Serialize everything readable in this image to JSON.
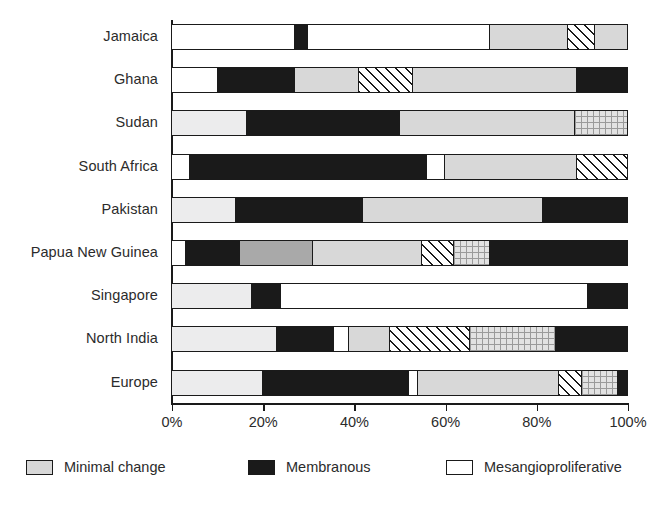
{
  "chart_data": {
    "type": "bar",
    "orientation": "horizontal",
    "stacked": true,
    "normalized": true,
    "title": "",
    "xlabel": "",
    "ylabel": "",
    "xlim": [
      0,
      100
    ],
    "grid": false,
    "legend_position": "bottom",
    "tick_labels": [
      "0%",
      "20%",
      "40%",
      "60%",
      "80%",
      "100%"
    ],
    "tick_values": [
      0,
      20,
      40,
      60,
      80,
      100
    ],
    "categories": [
      "Jamaica",
      "Ghana",
      "Sudan",
      "South Africa",
      "Pakistan",
      "Papua New Guinea",
      "Singapore",
      "North India",
      "Europe"
    ],
    "legend": [
      {
        "label": "Minimal change",
        "fill": "light",
        "swatch_color": "#ececed"
      },
      {
        "label": "Membranous",
        "fill": "black",
        "swatch_color": "#1a1a1a"
      },
      {
        "label": "Mesangioproliferative",
        "fill": "white",
        "swatch_color": "#ffffff"
      }
    ],
    "colors": {
      "white": "#ffffff",
      "black": "#1a1a1a",
      "light": "#d8d8d8",
      "lighter": "#ececed",
      "medium": "#a9a9a9",
      "hatch": "#ffffff",
      "grid": "#e2e2e2",
      "axis": "#1a1a1a",
      "text": "#2b2b2b"
    },
    "bars": [
      {
        "category": "Jamaica",
        "segments": [
          {
            "fill": "white",
            "value": 27.0
          },
          {
            "fill": "black",
            "value": 3.0
          },
          {
            "fill": "white",
            "value": 40.0
          },
          {
            "fill": "light",
            "value": 17.0
          },
          {
            "fill": "hatch",
            "value": 6.0
          },
          {
            "fill": "light",
            "value": 7.0
          }
        ]
      },
      {
        "category": "Ghana",
        "segments": [
          {
            "fill": "white",
            "value": 10.0
          },
          {
            "fill": "black",
            "value": 17.0
          },
          {
            "fill": "light",
            "value": 14.0
          },
          {
            "fill": "hatch",
            "value": 12.0
          },
          {
            "fill": "light",
            "value": 36.0
          },
          {
            "fill": "black",
            "value": 11.0
          }
        ]
      },
      {
        "category": "Sudan",
        "segments": [
          {
            "fill": "lighter",
            "value": 16.5
          },
          {
            "fill": "black",
            "value": 33.5
          },
          {
            "fill": "light",
            "value": 38.5
          },
          {
            "fill": "grid",
            "value": 11.5
          }
        ]
      },
      {
        "category": "South Africa",
        "segments": [
          {
            "fill": "white",
            "value": 4.0
          },
          {
            "fill": "black",
            "value": 52.0
          },
          {
            "fill": "white",
            "value": 4.0
          },
          {
            "fill": "light",
            "value": 29.0
          },
          {
            "fill": "hatch",
            "value": 11.0
          }
        ]
      },
      {
        "category": "Pakistan",
        "segments": [
          {
            "fill": "lighter",
            "value": 14.0
          },
          {
            "fill": "black",
            "value": 28.0
          },
          {
            "fill": "light",
            "value": 39.5
          },
          {
            "fill": "black",
            "value": 18.5
          }
        ]
      },
      {
        "category": "Papua New Guinea",
        "segments": [
          {
            "fill": "white",
            "value": 3.0
          },
          {
            "fill": "black",
            "value": 12.0
          },
          {
            "fill": "medium",
            "value": 16.0
          },
          {
            "fill": "light",
            "value": 24.0
          },
          {
            "fill": "hatch",
            "value": 7.0
          },
          {
            "fill": "grid",
            "value": 8.0
          },
          {
            "fill": "black",
            "value": 30.0
          }
        ]
      },
      {
        "category": "Singapore",
        "segments": [
          {
            "fill": "lighter",
            "value": 17.5
          },
          {
            "fill": "black",
            "value": 6.5
          },
          {
            "fill": "white",
            "value": 67.5
          },
          {
            "fill": "black",
            "value": 8.5
          }
        ]
      },
      {
        "category": "North India",
        "segments": [
          {
            "fill": "lighter",
            "value": 23.0
          },
          {
            "fill": "black",
            "value": 12.5
          },
          {
            "fill": "white",
            "value": 3.5
          },
          {
            "fill": "light",
            "value": 9.0
          },
          {
            "fill": "hatch",
            "value": 17.5
          },
          {
            "fill": "grid",
            "value": 19.0
          },
          {
            "fill": "black",
            "value": 15.5
          }
        ]
      },
      {
        "category": "Europe",
        "segments": [
          {
            "fill": "lighter",
            "value": 20.0
          },
          {
            "fill": "black",
            "value": 32.0
          },
          {
            "fill": "white",
            "value": 2.0
          },
          {
            "fill": "light",
            "value": 31.0
          },
          {
            "fill": "hatch",
            "value": 5.0
          },
          {
            "fill": "grid",
            "value": 8.0
          },
          {
            "fill": "black",
            "value": 2.0
          }
        ]
      }
    ]
  }
}
